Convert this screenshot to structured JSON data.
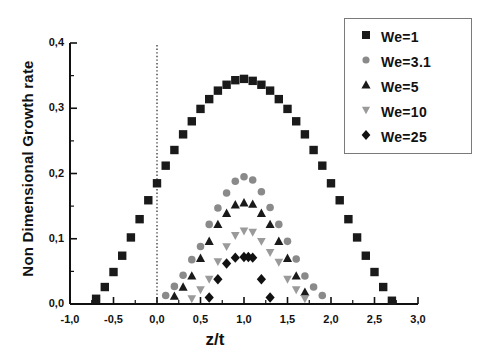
{
  "chart_data": {
    "type": "scatter",
    "title": "",
    "xlabel": "z/t",
    "ylabel": "Non Dimensional Growth rate",
    "xlim": [
      -1.0,
      3.0
    ],
    "ylim": [
      0.0,
      0.4
    ],
    "grid": false,
    "legend_position": "top-right",
    "xticks": [
      "-1,0",
      "-0,5",
      "0,0",
      "0,5",
      "1,0",
      "1,5",
      "2,0",
      "2,5",
      "3,0"
    ],
    "xtick_values": [
      -1.0,
      -0.5,
      0.0,
      0.5,
      1.0,
      1.5,
      2.0,
      2.5,
      3.0
    ],
    "yticks": [
      "0,0",
      "0,1",
      "0,2",
      "0,3",
      "0,4"
    ],
    "ytick_values": [
      0.0,
      0.1,
      0.2,
      0.3,
      0.4
    ],
    "annotations": [
      {
        "type": "vertical-dotted-line",
        "x": 0.0,
        "label": "reference line at z/t = 0"
      }
    ],
    "series": [
      {
        "name": "We=1",
        "marker": "square",
        "color": "#1a1a1a",
        "x": [
          -0.7,
          -0.6,
          -0.5,
          -0.4,
          -0.3,
          -0.2,
          -0.1,
          0.0,
          0.1,
          0.2,
          0.3,
          0.4,
          0.5,
          0.6,
          0.7,
          0.8,
          0.9,
          1.0,
          1.1,
          1.2,
          1.3,
          1.4,
          1.5,
          1.6,
          1.7,
          1.8,
          1.9,
          2.0,
          2.1,
          2.2,
          2.3,
          2.4,
          2.5,
          2.6,
          2.7
        ],
        "y": [
          0.008,
          0.026,
          0.049,
          0.074,
          0.102,
          0.13,
          0.159,
          0.185,
          0.212,
          0.236,
          0.26,
          0.28,
          0.299,
          0.314,
          0.327,
          0.336,
          0.343,
          0.345,
          0.342,
          0.336,
          0.327,
          0.314,
          0.299,
          0.28,
          0.26,
          0.236,
          0.212,
          0.185,
          0.159,
          0.13,
          0.102,
          0.074,
          0.049,
          0.026,
          0.005
        ]
      },
      {
        "name": "We=3.1",
        "marker": "circle",
        "color": "#8a8a8a",
        "x": [
          0.1,
          0.2,
          0.3,
          0.4,
          0.5,
          0.6,
          0.7,
          0.8,
          0.9,
          1.0,
          1.1,
          1.2,
          1.3,
          1.4,
          1.5,
          1.6,
          1.7,
          1.8,
          1.9
        ],
        "y": [
          0.013,
          0.027,
          0.044,
          0.068,
          0.088,
          0.122,
          0.147,
          0.17,
          0.188,
          0.195,
          0.19,
          0.172,
          0.148,
          0.122,
          0.096,
          0.069,
          0.043,
          0.026,
          0.013
        ]
      },
      {
        "name": "We=5",
        "marker": "triangle-up",
        "color": "#1a1a1a",
        "x": [
          0.2,
          0.3,
          0.4,
          0.5,
          0.6,
          0.7,
          0.8,
          0.9,
          1.0,
          1.1,
          1.2,
          1.3,
          1.4,
          1.5,
          1.6,
          1.7
        ],
        "y": [
          0.012,
          0.026,
          0.043,
          0.07,
          0.096,
          0.122,
          0.139,
          0.152,
          0.155,
          0.153,
          0.139,
          0.122,
          0.096,
          0.07,
          0.043,
          0.018
        ]
      },
      {
        "name": "We=10",
        "marker": "triangle-down",
        "color": "#9a9a9a",
        "x": [
          0.4,
          0.5,
          0.6,
          0.7,
          0.8,
          0.9,
          1.0,
          1.1,
          1.2,
          1.3,
          1.4,
          1.5,
          1.6,
          1.7
        ],
        "y": [
          0.008,
          0.022,
          0.038,
          0.065,
          0.088,
          0.105,
          0.112,
          0.11,
          0.096,
          0.079,
          0.064,
          0.038,
          0.022,
          0.008
        ]
      },
      {
        "name": "We=25",
        "marker": "diamond",
        "color": "#111111",
        "x": [
          0.6,
          0.7,
          0.8,
          0.9,
          1.0,
          1.05,
          1.1,
          1.2,
          1.3
        ],
        "y": [
          0.01,
          0.038,
          0.062,
          0.071,
          0.072,
          0.072,
          0.071,
          0.038,
          0.01
        ]
      }
    ]
  },
  "legend": {
    "items": [
      {
        "label": "We=1",
        "marker": "square"
      },
      {
        "label": "We=3.1",
        "marker": "circle"
      },
      {
        "label": "We=5",
        "marker": "triangle-up"
      },
      {
        "label": "We=10",
        "marker": "triangle-down"
      },
      {
        "label": "We=25",
        "marker": "diamond"
      }
    ]
  }
}
